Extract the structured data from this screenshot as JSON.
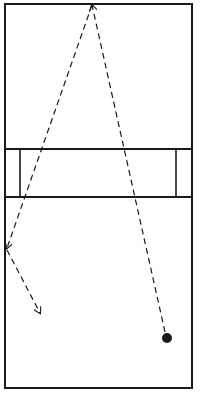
{
  "diagram": {
    "type": "court-shot-path",
    "colors": {
      "background": "#ffffff",
      "line": "#1a1a1a"
    },
    "court": {
      "x1": 5,
      "y1": 4,
      "x2": 192,
      "y2": 388
    },
    "center_band": {
      "y_top": 149,
      "y_bottom": 197,
      "inner_left_x": 20,
      "inner_right_x": 176
    },
    "ball": {
      "cx": 167,
      "cy": 338,
      "r": 5
    },
    "paths": [
      {
        "name": "ball-to-front-wall",
        "from": [
          165,
          332
        ],
        "to": [
          92,
          5
        ],
        "arrow": true
      },
      {
        "name": "front-wall-to-side-wall",
        "from": [
          92,
          5
        ],
        "to": [
          7,
          248
        ],
        "arrow": true
      },
      {
        "name": "side-wall-rebound",
        "from": [
          7,
          250
        ],
        "to": [
          40,
          313
        ],
        "arrow": true
      }
    ]
  }
}
